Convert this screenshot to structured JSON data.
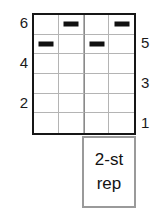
{
  "figure": {
    "grid": {
      "columns": 4,
      "rows": 6,
      "marks": [
        {
          "row": 1,
          "col": 2,
          "glyph": "dash-mark"
        },
        {
          "row": 1,
          "col": 4,
          "glyph": "dash-mark"
        },
        {
          "row": 2,
          "col": 1,
          "glyph": "dash-mark"
        },
        {
          "row": 2,
          "col": 3,
          "glyph": "dash-mark"
        }
      ]
    },
    "axis_left": {
      "labels": [
        "6",
        "4",
        "2"
      ]
    },
    "axis_right": {
      "labels": [
        "5",
        "3",
        "1"
      ]
    },
    "caption": {
      "line1": "2-st",
      "line2": "rep"
    },
    "colors": {
      "grid_border": "#161616",
      "grid_line": "#b4b4b4",
      "mark": "#111111",
      "caption_border": "#9a9a9a",
      "text": "#1a1a1a",
      "background": "#ffffff"
    }
  }
}
